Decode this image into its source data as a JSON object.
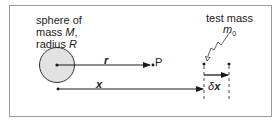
{
  "diagram": {
    "sphere_label": {
      "line1": "sphere of",
      "line2_prefix": "mass ",
      "line2_var": "M",
      "line2_suffix": ",",
      "line3_prefix": "radius ",
      "line3_var": "R"
    },
    "test_mass_label": "test mass",
    "test_mass_symbol": "m",
    "test_mass_subscript": "0",
    "r_label": "r",
    "point_label": "P",
    "x_label": "x",
    "dx_label_delta": "δ",
    "dx_label_var": "x",
    "colors": {
      "border": "#9a9a9a",
      "sphere_fill": "#e2e2e2",
      "line": "#1a1a1a"
    }
  }
}
